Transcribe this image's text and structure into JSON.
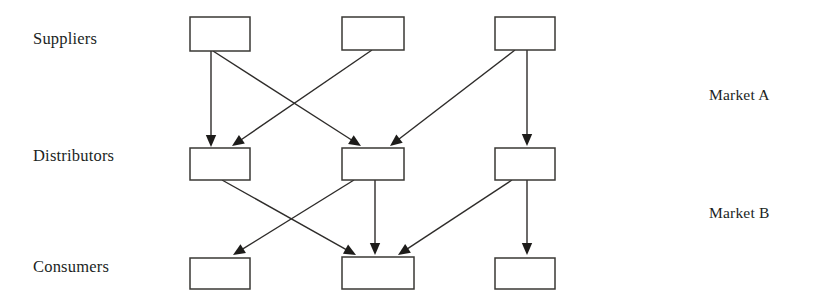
{
  "diagram": {
    "background_color": "#ffffff",
    "box_stroke_color": "#3a3835",
    "edge_color": "#2e2c2a",
    "text_color": "#211f1e",
    "row_labels": [
      {
        "id": "suppliers",
        "text": "Suppliers",
        "x": 33,
        "y": 29
      },
      {
        "id": "distributors",
        "text": "Distributors",
        "x": 33,
        "y": 146
      },
      {
        "id": "consumers",
        "text": "Consumers",
        "x": 33,
        "y": 257
      }
    ],
    "market_labels": [
      {
        "id": "market-a",
        "text": "Market A",
        "x": 709,
        "y": 86
      },
      {
        "id": "market-b",
        "text": "Market B",
        "x": 709,
        "y": 204
      }
    ],
    "nodes": [
      {
        "id": "supplier-1",
        "row": "suppliers",
        "label": "",
        "x": 190,
        "y": 17,
        "w": 60,
        "h": 34
      },
      {
        "id": "supplier-2",
        "row": "suppliers",
        "label": "",
        "x": 342,
        "y": 17,
        "w": 62,
        "h": 33
      },
      {
        "id": "supplier-3",
        "row": "suppliers",
        "label": "",
        "x": 495,
        "y": 17,
        "w": 60,
        "h": 33
      },
      {
        "id": "distributor-1",
        "row": "distributors",
        "label": "",
        "x": 190,
        "y": 148,
        "w": 60,
        "h": 32
      },
      {
        "id": "distributor-2",
        "row": "distributors",
        "label": "",
        "x": 342,
        "y": 148,
        "w": 62,
        "h": 32
      },
      {
        "id": "distributor-3",
        "row": "distributors",
        "label": "",
        "x": 495,
        "y": 148,
        "w": 60,
        "h": 32
      },
      {
        "id": "consumer-1",
        "row": "consumers",
        "label": "",
        "x": 190,
        "y": 258,
        "w": 60,
        "h": 31
      },
      {
        "id": "consumer-2",
        "row": "consumers",
        "label": "",
        "x": 342,
        "y": 257,
        "w": 72,
        "h": 32
      },
      {
        "id": "consumer-3",
        "row": "consumers",
        "label": "",
        "x": 495,
        "y": 258,
        "w": 60,
        "h": 31
      }
    ],
    "edges": [
      {
        "id": "edge-s1-d1",
        "from": "supplier-1",
        "to": "distributor-1",
        "x1": 211,
        "y1": 51,
        "x2": 211,
        "y2": 147
      },
      {
        "id": "edge-s1-d2",
        "from": "supplier-1",
        "to": "distributor-2",
        "x1": 213,
        "y1": 51,
        "x2": 361,
        "y2": 146
      },
      {
        "id": "edge-s2-d1",
        "from": "supplier-2",
        "to": "distributor-1",
        "x1": 372,
        "y1": 50,
        "x2": 232,
        "y2": 146
      },
      {
        "id": "edge-s3-d2",
        "from": "supplier-3",
        "to": "distributor-2",
        "x1": 515,
        "y1": 50,
        "x2": 390,
        "y2": 146
      },
      {
        "id": "edge-s3-d3",
        "from": "supplier-3",
        "to": "distributor-3",
        "x1": 527,
        "y1": 50,
        "x2": 527,
        "y2": 146
      },
      {
        "id": "edge-d1-c2",
        "from": "distributor-1",
        "to": "consumer-2",
        "x1": 222,
        "y1": 180,
        "x2": 356,
        "y2": 255
      },
      {
        "id": "edge-d2-c1",
        "from": "distributor-2",
        "to": "consumer-1",
        "x1": 354,
        "y1": 180,
        "x2": 233,
        "y2": 255
      },
      {
        "id": "edge-d2-c2",
        "from": "distributor-2",
        "to": "consumer-2",
        "x1": 375,
        "y1": 180,
        "x2": 375,
        "y2": 255
      },
      {
        "id": "edge-d3-c2",
        "from": "distributor-3",
        "to": "consumer-2",
        "x1": 512,
        "y1": 180,
        "x2": 398,
        "y2": 255
      },
      {
        "id": "edge-d3-c3",
        "from": "distributor-3",
        "to": "consumer-3",
        "x1": 527,
        "y1": 180,
        "x2": 527,
        "y2": 255
      }
    ]
  }
}
